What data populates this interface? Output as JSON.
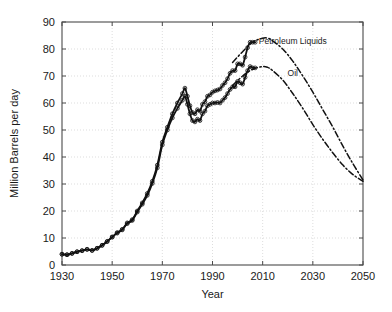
{
  "chart_data": {
    "type": "line",
    "title": "",
    "xlabel": "Year",
    "ylabel": "Million Barrels per day",
    "xlim": [
      1930,
      2050
    ],
    "ylim": [
      0,
      90
    ],
    "xticks": [
      1930,
      1950,
      1970,
      1990,
      2010,
      2030,
      2050
    ],
    "yticks": [
      0,
      10,
      20,
      30,
      40,
      50,
      60,
      70,
      80,
      90
    ],
    "grid": true,
    "legend_position": "inline-right",
    "annotations": [
      {
        "text": "Petroleum Liquids",
        "x": 2022,
        "y": 82
      },
      {
        "text": "Oil",
        "x": 2022,
        "y": 70
      }
    ],
    "series": [
      {
        "name": "Petroleum Liquids",
        "style": "solid-history",
        "x": [
          1930,
          1932,
          1934,
          1936,
          1938,
          1940,
          1942,
          1944,
          1946,
          1948,
          1950,
          1952,
          1954,
          1956,
          1958,
          1960,
          1962,
          1964,
          1966,
          1968,
          1970,
          1972,
          1974,
          1976,
          1978,
          1979,
          1980,
          1981,
          1982,
          1983,
          1984,
          1985,
          1986,
          1987,
          1988,
          1989,
          1990,
          1991,
          1992,
          1993,
          1994,
          1995,
          1996,
          1997,
          1998,
          1999,
          2000,
          2001,
          2002,
          2003,
          2004,
          2005,
          2006,
          2007
        ],
        "values": [
          4.0,
          3.8,
          4.3,
          4.9,
          5.3,
          5.8,
          5.4,
          6.2,
          7.3,
          8.7,
          10.4,
          12.0,
          13.2,
          15.6,
          16.8,
          20.0,
          23.0,
          26.5,
          31.0,
          37.0,
          45.5,
          51.0,
          56.0,
          60.0,
          63.5,
          65.5,
          62.5,
          59.0,
          56.5,
          56.0,
          57.5,
          57.0,
          59.5,
          60.5,
          62.5,
          63.0,
          64.0,
          64.5,
          64.8,
          65.2,
          66.5,
          67.5,
          69.0,
          71.0,
          72.0,
          72.0,
          74.5,
          74.5,
          74.0,
          77.0,
          80.5,
          82.5,
          82.5,
          82.5
        ]
      },
      {
        "name": "Oil",
        "style": "solid-history",
        "x": [
          1930,
          1932,
          1934,
          1936,
          1938,
          1940,
          1942,
          1944,
          1946,
          1948,
          1950,
          1952,
          1954,
          1956,
          1958,
          1960,
          1962,
          1964,
          1966,
          1968,
          1970,
          1972,
          1974,
          1976,
          1978,
          1979,
          1980,
          1981,
          1982,
          1983,
          1984,
          1985,
          1986,
          1987,
          1988,
          1989,
          1990,
          1991,
          1992,
          1993,
          1994,
          1995,
          1996,
          1997,
          1998,
          1999,
          2000,
          2001,
          2002,
          2003,
          2004,
          2005,
          2006,
          2007
        ],
        "values": [
          4.0,
          3.8,
          4.3,
          4.9,
          5.3,
          5.8,
          5.4,
          6.2,
          7.3,
          8.7,
          10.3,
          11.8,
          13.0,
          15.3,
          16.5,
          19.6,
          22.5,
          25.8,
          30.2,
          36.0,
          44.5,
          50.0,
          54.5,
          58.0,
          61.0,
          62.5,
          59.5,
          56.0,
          53.5,
          53.0,
          54.0,
          53.5,
          56.0,
          57.0,
          59.0,
          59.5,
          60.0,
          60.0,
          60.2,
          60.0,
          61.0,
          62.0,
          63.5,
          65.0,
          66.0,
          66.0,
          68.0,
          67.5,
          67.0,
          69.5,
          72.0,
          73.5,
          73.0,
          73.0
        ]
      },
      {
        "name": "Petroleum Liquids Projection",
        "style": "dash-dot",
        "x": [
          1998,
          2002,
          2006,
          2010,
          2012,
          2014,
          2018,
          2022,
          2026,
          2030,
          2034,
          2038,
          2042,
          2046,
          2050
        ],
        "values": [
          75.0,
          79.0,
          82.5,
          84.0,
          84.0,
          83.0,
          80.0,
          75.5,
          70.0,
          64.0,
          57.5,
          51.0,
          44.0,
          37.5,
          31.5
        ]
      },
      {
        "name": "Oil Projection",
        "style": "dash-dot",
        "x": [
          1998,
          2002,
          2006,
          2010,
          2012,
          2014,
          2018,
          2022,
          2026,
          2030,
          2034,
          2038,
          2042,
          2046,
          2050
        ],
        "values": [
          66.5,
          70.0,
          72.5,
          73.5,
          73.2,
          72.0,
          68.5,
          63.5,
          58.0,
          52.0,
          46.5,
          41.5,
          37.0,
          33.5,
          31.0
        ]
      }
    ],
    "scatter_points": {
      "name": "Observed annual data",
      "marker": "open-circle",
      "note": "One open circle per observation year for both series"
    }
  }
}
